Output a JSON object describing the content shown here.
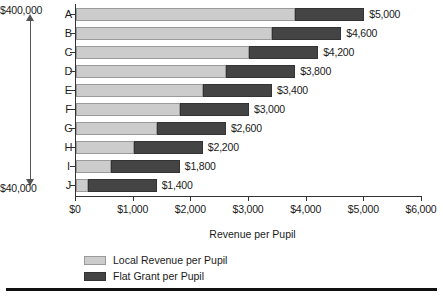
{
  "chart_data": {
    "type": "bar",
    "orientation": "horizontal",
    "stacked": true,
    "title": "",
    "xlabel": "Revenue per Pupil",
    "ylabel": "",
    "xlim": [
      0,
      6000
    ],
    "xticks": [
      0,
      1000,
      2000,
      3000,
      4000,
      5000,
      6000
    ],
    "xtick_labels": [
      "$0",
      "$1,000",
      "$2,000",
      "$3,000",
      "$4,000",
      "$5,000",
      "$6,000"
    ],
    "grid": false,
    "legend_position": "below",
    "categories": [
      "A",
      "B",
      "C",
      "D",
      "E",
      "F",
      "G",
      "H",
      "I",
      "J"
    ],
    "series": [
      {
        "name": "Local Revenue per Pupil",
        "color": "#cccccc",
        "values": [
          3800,
          3400,
          3000,
          2600,
          2200,
          1800,
          1400,
          1000,
          600,
          200
        ]
      },
      {
        "name": "Flat Grant per Pupil",
        "color": "#444444",
        "values": [
          1200,
          1200,
          1200,
          1200,
          1200,
          1200,
          1200,
          1200,
          1200,
          1200
        ]
      }
    ],
    "totals": [
      5000,
      4600,
      4200,
      3800,
      3400,
      3000,
      2600,
      2200,
      1800,
      1400
    ],
    "total_labels": [
      "$5,000",
      "$4,600",
      "$4,200",
      "$3,800",
      "$3,400",
      "$3,000",
      "$2,600",
      "$2,200",
      "$1,800",
      "$1,400"
    ],
    "annotations": {
      "wealth_axis_top": "$400,000",
      "wealth_axis_bottom": "$40,000"
    }
  },
  "wealth_axis": {
    "top_label": "$400,000",
    "bottom_label": "$40,000"
  },
  "x_axis": {
    "title": "Revenue per Pupil",
    "ticks": [
      "$0",
      "$1,000",
      "$2,000",
      "$3,000",
      "$4,000",
      "$5,000",
      "$6,000"
    ]
  },
  "categories": [
    "A",
    "B",
    "C",
    "D",
    "E",
    "F",
    "G",
    "H",
    "I",
    "J"
  ],
  "bar_labels": [
    "$5,000",
    "$4,600",
    "$4,200",
    "$3,800",
    "$3,400",
    "$3,000",
    "$2,600",
    "$2,200",
    "$1,800",
    "$1,400"
  ],
  "legend": {
    "items": [
      {
        "label": "Local Revenue per Pupil",
        "color": "#cccccc"
      },
      {
        "label": "Flat Grant per Pupil",
        "color": "#444444"
      }
    ]
  }
}
